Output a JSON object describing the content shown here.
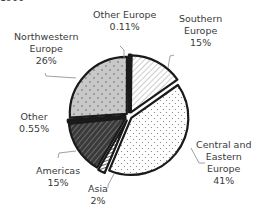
{
  "header": {
    "cut_title": "1900"
  },
  "chart_data": {
    "type": "pie",
    "title": "",
    "exploded": true,
    "slices": [
      {
        "label": "Southern Europe",
        "value": 15,
        "display": "15%",
        "fill": "#ffffff",
        "pattern": "diagonal-light"
      },
      {
        "label": "Central and Eastern Europe",
        "value": 41,
        "display": "41%",
        "fill": "#ffffff",
        "pattern": "dots"
      },
      {
        "label": "Asia",
        "value": 2,
        "display": "2%",
        "fill": "#ffffff",
        "pattern": "hatch-light"
      },
      {
        "label": "Americas",
        "value": 15,
        "display": "15%",
        "fill": "#444444",
        "pattern": "diagonal-dark"
      },
      {
        "label": "Other",
        "value": 0.55,
        "display": "0.55%",
        "fill": "#111111",
        "pattern": "solid"
      },
      {
        "label": "Northwestern Europe",
        "value": 26,
        "display": "26%",
        "fill": "#c8c8c8",
        "pattern": "dots"
      },
      {
        "label": "Other Europe",
        "value": 0.11,
        "display": "0.11%",
        "fill": "#111111",
        "pattern": "solid"
      }
    ]
  },
  "labels": {
    "southern": {
      "l1": "Southern",
      "l2": "Europe",
      "pct": "15%"
    },
    "central": {
      "l1": "Central and",
      "l2": "Eastern",
      "l3": "Europe",
      "pct": "41%"
    },
    "asia": {
      "l1": "Asia",
      "pct": "2%"
    },
    "americas": {
      "l1": "Americas",
      "pct": "15%"
    },
    "other": {
      "l1": "Other",
      "pct": "0.55%"
    },
    "northwestern": {
      "l1": "Northwestern",
      "l2": "Europe",
      "pct": "26%"
    },
    "other_europe": {
      "l1": "Other Europe",
      "pct": "0.11%"
    }
  }
}
